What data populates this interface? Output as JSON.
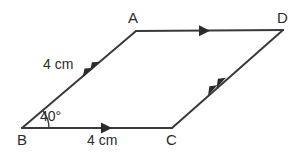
{
  "figure": {
    "type": "parallelogram",
    "stroke_color": "#3a3a3a",
    "text_color": "#2b2b2b",
    "background_color": "#ffffff",
    "stroke_width": 2,
    "vertices": [
      {
        "name": "A",
        "label": "A",
        "x": 136,
        "y": 31
      },
      {
        "name": "B",
        "label": "B",
        "x": 22,
        "y": 128
      },
      {
        "name": "C",
        "label": "C",
        "x": 172,
        "y": 128
      },
      {
        "name": "D",
        "label": "D",
        "x": 283,
        "y": 30
      }
    ],
    "edges": [
      {
        "name": "edge-ad",
        "from": "A",
        "to": "D",
        "tick_marks": 1,
        "direction": "right"
      },
      {
        "name": "edge-bc",
        "from": "B",
        "to": "C",
        "tick_marks": 1,
        "direction": "right"
      },
      {
        "name": "edge-ba",
        "from": "B",
        "to": "A",
        "tick_marks": 2,
        "direction": "up-right"
      },
      {
        "name": "edge-cd",
        "from": "C",
        "to": "D",
        "tick_marks": 2,
        "direction": "up-right"
      }
    ],
    "side_labels": [
      {
        "name": "side-label-ba",
        "edge": "edge-ba",
        "text": "4 cm"
      },
      {
        "name": "side-label-bc",
        "edge": "edge-bc",
        "text": "4 cm"
      }
    ],
    "angles": [
      {
        "name": "angle-b",
        "vertex": "B",
        "text": "40°",
        "value": 40,
        "unit": "degrees",
        "arc_radius": 27
      }
    ]
  }
}
